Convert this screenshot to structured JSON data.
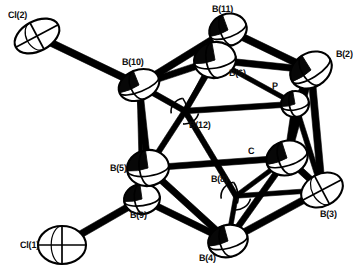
{
  "figure": {
    "kind": "ortep-thermal-ellipsoid-plot",
    "background_color": "#ffffff",
    "ink_color": "#000000",
    "bond_color": "#000000",
    "ellipsoid_fill": "#ffffff",
    "ellipsoid_outline": "#000000"
  },
  "atoms": [
    {
      "id": "Cl2",
      "label": "Cl(2)",
      "element": "Cl",
      "x": 37,
      "y": 36,
      "rx": 24,
      "ry": 15,
      "rot": -28,
      "style": "open",
      "label_x": 8,
      "label_y": 10,
      "z": 9
    },
    {
      "id": "Cl1",
      "label": "Cl(1)",
      "element": "Cl",
      "x": 62,
      "y": 245,
      "rx": 24,
      "ry": 19,
      "rot": 0,
      "style": "open",
      "label_x": 20,
      "label_y": 240,
      "z": 9
    },
    {
      "id": "B11",
      "label": "B(11)",
      "element": "B",
      "x": 228,
      "y": 30,
      "rx": 19,
      "ry": 16,
      "rot": -20,
      "style": "octant",
      "label_x": 212,
      "label_y": 4,
      "z": 7
    },
    {
      "id": "B6",
      "label": "B(6)",
      "element": "B",
      "x": 215,
      "y": 60,
      "rx": 21,
      "ry": 18,
      "rot": -10,
      "style": "octant",
      "label_x": 229,
      "label_y": 68,
      "z": 8
    },
    {
      "id": "B2",
      "label": "B(2)",
      "element": "B",
      "x": 311,
      "y": 70,
      "rx": 22,
      "ry": 17,
      "rot": -32,
      "style": "octant",
      "label_x": 336,
      "label_y": 49,
      "z": 8
    },
    {
      "id": "B10",
      "label": "B(10)",
      "element": "B",
      "x": 139,
      "y": 85,
      "rx": 21,
      "ry": 15,
      "rot": -22,
      "style": "octant",
      "label_x": 122,
      "label_y": 57,
      "z": 8
    },
    {
      "id": "P",
      "label": "P",
      "element": "P",
      "x": 295,
      "y": 104,
      "rx": 14,
      "ry": 13,
      "rot": -10,
      "style": "octant",
      "label_x": 272,
      "label_y": 81,
      "z": 5
    },
    {
      "id": "B12",
      "label": "B(12)",
      "element": "B",
      "x": 185,
      "y": 111,
      "rx": 14,
      "ry": 13,
      "rot": -10,
      "style": "hidden",
      "label_x": 189,
      "label_y": 120,
      "z": 2
    },
    {
      "id": "C",
      "label": "C",
      "element": "C",
      "x": 287,
      "y": 158,
      "rx": 21,
      "ry": 17,
      "rot": -18,
      "style": "octant",
      "label_x": 248,
      "label_y": 146,
      "z": 8
    },
    {
      "id": "B5",
      "label": "B(5)",
      "element": "B",
      "x": 148,
      "y": 168,
      "rx": 21,
      "ry": 18,
      "rot": -8,
      "style": "octant",
      "label_x": 110,
      "label_y": 163,
      "z": 8
    },
    {
      "id": "B8",
      "label": "B(8)",
      "element": "B",
      "x": 236,
      "y": 196,
      "rx": 15,
      "ry": 14,
      "rot": -10,
      "style": "hidden",
      "label_x": 211,
      "label_y": 174,
      "z": 3
    },
    {
      "id": "B9",
      "label": "B(9)",
      "element": "B",
      "x": 142,
      "y": 199,
      "rx": 18,
      "ry": 15,
      "rot": -8,
      "style": "octant",
      "label_x": 130,
      "label_y": 210,
      "z": 7
    },
    {
      "id": "B3",
      "label": "B(3)",
      "element": "B",
      "x": 322,
      "y": 190,
      "rx": 22,
      "ry": 16,
      "rot": -28,
      "style": "open",
      "label_x": 320,
      "label_y": 209,
      "z": 8
    },
    {
      "id": "B4",
      "label": "B(4)",
      "element": "B",
      "x": 228,
      "y": 241,
      "rx": 20,
      "ry": 16,
      "rot": -15,
      "style": "octant",
      "label_x": 199,
      "label_y": 253,
      "z": 8
    }
  ],
  "bonds": [
    {
      "from": "Cl2",
      "to": "B10",
      "w": 7,
      "kind": "exo"
    },
    {
      "from": "Cl1",
      "to": "B9",
      "w": 7,
      "kind": "exo"
    },
    {
      "from": "B10",
      "to": "B11",
      "w": 7,
      "kind": "cage"
    },
    {
      "from": "B10",
      "to": "B6",
      "w": 6.5,
      "kind": "cage"
    },
    {
      "from": "B11",
      "to": "B6",
      "w": 6.5,
      "kind": "cage"
    },
    {
      "from": "B11",
      "to": "B2",
      "w": 7,
      "kind": "cage"
    },
    {
      "from": "B6",
      "to": "B2",
      "w": 6.5,
      "kind": "cage"
    },
    {
      "from": "B6",
      "to": "P",
      "w": 4.5,
      "kind": "cage"
    },
    {
      "from": "B2",
      "to": "P",
      "w": 5,
      "kind": "cage"
    },
    {
      "from": "B2",
      "to": "C",
      "w": 6.5,
      "kind": "cage"
    },
    {
      "from": "B2",
      "to": "B3",
      "w": 7,
      "kind": "cage"
    },
    {
      "from": "B10",
      "to": "B5",
      "w": 6.5,
      "kind": "cage"
    },
    {
      "from": "B10",
      "to": "B9",
      "w": 4,
      "kind": "cage"
    },
    {
      "from": "B10",
      "to": "B12",
      "w": 5.5,
      "kind": "cage"
    },
    {
      "from": "B6",
      "to": "B12",
      "w": 5.5,
      "kind": "cage"
    },
    {
      "from": "B12",
      "to": "P",
      "w": 5.5,
      "kind": "cage"
    },
    {
      "from": "B12",
      "to": "B5",
      "w": 5.5,
      "kind": "cage"
    },
    {
      "from": "B12",
      "to": "B8",
      "w": 5.5,
      "kind": "cage"
    },
    {
      "from": "B5",
      "to": "B9",
      "w": 5,
      "kind": "cage"
    },
    {
      "from": "B5",
      "to": "C",
      "w": 6,
      "kind": "cage"
    },
    {
      "from": "B5",
      "to": "B4",
      "w": 6.5,
      "kind": "cage"
    },
    {
      "from": "B9",
      "to": "B4",
      "w": 6.5,
      "kind": "cage"
    },
    {
      "from": "B8",
      "to": "C",
      "w": 4.5,
      "kind": "cage"
    },
    {
      "from": "B8",
      "to": "B4",
      "w": 4.5,
      "kind": "cage"
    },
    {
      "from": "B8",
      "to": "B3",
      "w": 4.5,
      "kind": "cage"
    },
    {
      "from": "C",
      "to": "B3",
      "w": 6.5,
      "kind": "cage"
    },
    {
      "from": "C",
      "to": "B4",
      "w": 6,
      "kind": "cage"
    },
    {
      "from": "C",
      "to": "P",
      "w": 5.5,
      "kind": "cage"
    },
    {
      "from": "B3",
      "to": "B4",
      "w": 7,
      "kind": "cage"
    },
    {
      "from": "B11",
      "to": "B12",
      "w": 3.5,
      "kind": "cage-back"
    },
    {
      "from": "P",
      "to": "B3",
      "w": 5,
      "kind": "cage"
    }
  ],
  "labels": [
    {
      "id": "Cl2",
      "text": "Cl(2)"
    },
    {
      "id": "B11",
      "text": "B(11)"
    },
    {
      "id": "B2",
      "text": "B(2)"
    },
    {
      "id": "B10",
      "text": "B(10)"
    },
    {
      "id": "B6",
      "text": "B(6)"
    },
    {
      "id": "P",
      "text": "P"
    },
    {
      "id": "B12",
      "text": "B(12)"
    },
    {
      "id": "C",
      "text": "C"
    },
    {
      "id": "B5",
      "text": "B(5)"
    },
    {
      "id": "B8",
      "text": "B(8)"
    },
    {
      "id": "B9",
      "text": "B(9)"
    },
    {
      "id": "B3",
      "text": "B(3)"
    },
    {
      "id": "Cl1",
      "text": "Cl(1)"
    },
    {
      "id": "B4",
      "text": "B(4)"
    }
  ]
}
